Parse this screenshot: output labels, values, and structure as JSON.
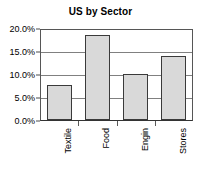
{
  "chart_data": {
    "type": "bar",
    "title": "US by Sector",
    "xlabel": "",
    "ylabel": "",
    "categories": [
      "Textile",
      "Food",
      "Engin",
      "Stores"
    ],
    "values": [
      7.6,
      18.5,
      10.1,
      14.0
    ],
    "ylim": [
      0,
      20
    ],
    "ytick_labels": [
      "0.0%",
      "5.0%",
      "10.0%",
      "15.0%",
      "20.0%"
    ],
    "ytick_values": [
      0,
      5,
      10,
      15,
      20
    ],
    "grid": true,
    "legend": false,
    "legend_position": "none",
    "bar_fill_color": "#d9d9d9",
    "bar_border_color": "#3a3a3a",
    "gridline_color": "#808080",
    "plot_border_color": "#565656",
    "text_color": "#000000",
    "xtick_label_rotation": -90,
    "value_format": "percent"
  }
}
